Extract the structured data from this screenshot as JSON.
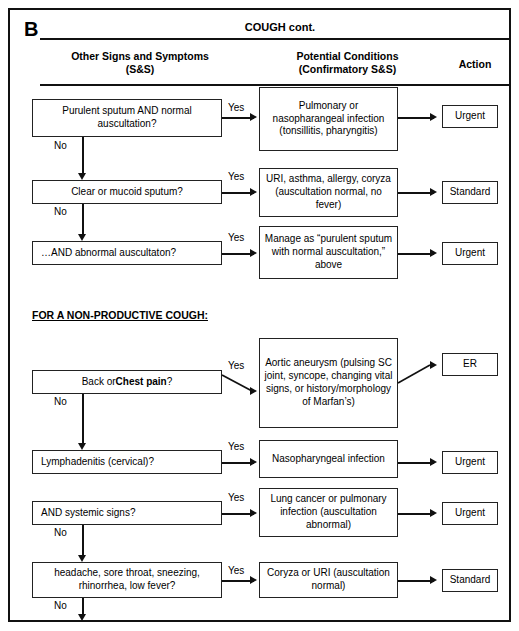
{
  "panel": {
    "letter": "B"
  },
  "header": {
    "title": "COUGH cont.",
    "columns": {
      "signs": "Other Signs and Symptoms\n(S&S)",
      "signs_line1": "Other Signs and Symptoms",
      "signs_line2": "(S&S)",
      "conditions_line1": "Potential Conditions",
      "conditions_line2": "(Confirmatory S&S)",
      "action": "Action"
    }
  },
  "sections": [
    {
      "id": "productive",
      "heading": null,
      "rows": [
        {
          "question": "Purulent sputum AND normal auscultation?",
          "yes_label": "Yes",
          "no_label": "No",
          "condition": "Pulmonary or nasopharangeal infection (tonsillitis, pharyngitis)",
          "action": "Urgent"
        },
        {
          "question": "Clear or mucoid sputum?",
          "yes_label": "Yes",
          "no_label": "No",
          "condition": "URI, asthma, allergy, coryza (auscultation normal, no fever)",
          "action": "Standard"
        },
        {
          "question": "…AND abnormal auscultaton?",
          "yes_label": "Yes",
          "no_label": null,
          "condition": "Manage as “purulent sputum with normal auscultation,” above",
          "action": "Urgent"
        }
      ]
    },
    {
      "id": "non-productive",
      "heading": "FOR A NON-PRODUCTIVE COUGH:",
      "rows": [
        {
          "question_prefix": "Back or ",
          "question_bold": "Chest pain",
          "question_suffix": "?",
          "yes_label": "Yes",
          "no_label": "No",
          "condition": "Aortic aneurysm (pulsing SC joint, syncope, changing vital signs, or history/morphology of Marfan’s)",
          "action": "ER"
        },
        {
          "question": "Lymphadenitis (cervical)?",
          "yes_label": "Yes",
          "no_label": null,
          "condition": "Nasopharyngeal infection",
          "action": "Urgent"
        },
        {
          "question": "AND systemic signs?",
          "yes_label": "Yes",
          "no_label": "No",
          "condition": "Lung cancer or pulmonary infection (auscultation abnormal)",
          "action": "Urgent"
        },
        {
          "question": "headache, sore throat, sneezing, rhinorrhea, low fever?",
          "yes_label": "Yes",
          "no_label": "No",
          "condition": "Coryza or URI (auscultation normal)",
          "action": "Standard"
        }
      ]
    }
  ],
  "colors": {
    "ink": "#111111",
    "box_border": "#222222",
    "background": "#ffffff"
  }
}
